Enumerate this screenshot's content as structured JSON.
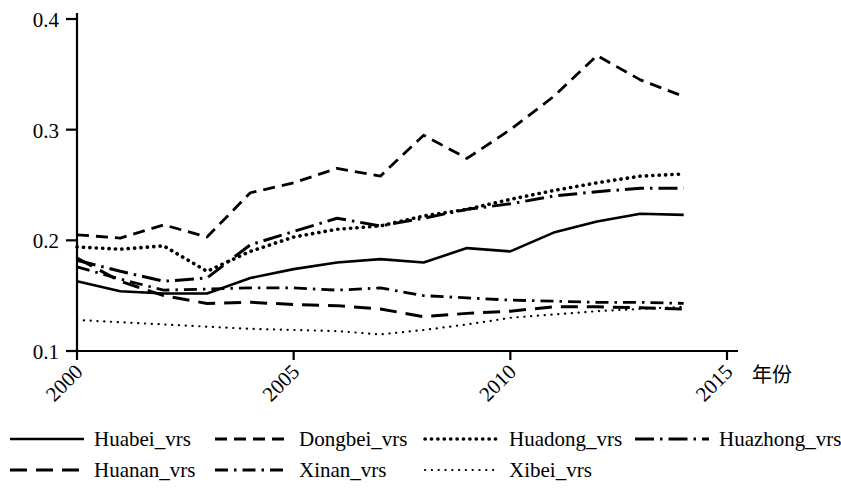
{
  "chart_data": {
    "type": "line",
    "title": "",
    "xlabel": "年份",
    "ylabel": "",
    "xlim": [
      2000,
      2015
    ],
    "ylim": [
      0.1,
      0.4
    ],
    "grid": false,
    "legend_position": "bottom",
    "x": [
      2000,
      2001,
      2002,
      2003,
      2004,
      2005,
      2006,
      2007,
      2008,
      2009,
      2010,
      2011,
      2012,
      2013,
      2014
    ],
    "xticks": [
      "2000",
      "2005",
      "2010",
      "2015"
    ],
    "xtick_values": [
      2000,
      2005,
      2010,
      2015
    ],
    "yticks": [
      "0.1",
      "0.2",
      "0.3",
      "0.4"
    ],
    "ytick_values": [
      0.1,
      0.2,
      0.3,
      0.4
    ],
    "series": [
      {
        "name": "Huabei_vrs",
        "style": "solid",
        "values": [
          0.163,
          0.154,
          0.152,
          0.152,
          0.166,
          0.174,
          0.18,
          0.183,
          0.18,
          0.193,
          0.19,
          0.207,
          0.217,
          0.224,
          0.223
        ]
      },
      {
        "name": "Dongbei_vrs",
        "style": "dashed",
        "values": [
          0.205,
          0.202,
          0.214,
          0.203,
          0.243,
          0.252,
          0.265,
          0.258,
          0.295,
          0.274,
          0.3,
          0.33,
          0.367,
          0.345,
          0.33
        ]
      },
      {
        "name": "Huadong_vrs",
        "style": "dotted",
        "values": [
          0.194,
          0.192,
          0.195,
          0.172,
          0.19,
          0.203,
          0.21,
          0.213,
          0.222,
          0.228,
          0.237,
          0.245,
          0.252,
          0.258,
          0.26
        ]
      },
      {
        "name": "Huazhong_vrs",
        "style": "dashdot-long",
        "values": [
          0.182,
          0.172,
          0.163,
          0.166,
          0.196,
          0.208,
          0.22,
          0.213,
          0.22,
          0.228,
          0.233,
          0.24,
          0.244,
          0.247,
          0.247
        ]
      },
      {
        "name": "Huanan_vrs",
        "style": "longdash",
        "values": [
          0.184,
          0.163,
          0.15,
          0.143,
          0.144,
          0.142,
          0.141,
          0.138,
          0.131,
          0.134,
          0.136,
          0.14,
          0.14,
          0.139,
          0.138
        ]
      },
      {
        "name": "Xinan_vrs",
        "style": "dashdot",
        "values": [
          0.176,
          0.165,
          0.155,
          0.156,
          0.157,
          0.157,
          0.155,
          0.157,
          0.15,
          0.148,
          0.146,
          0.145,
          0.144,
          0.144,
          0.143
        ]
      },
      {
        "name": "Xibei_vrs",
        "style": "finedot",
        "values": [
          0.128,
          0.126,
          0.124,
          0.122,
          0.12,
          0.119,
          0.118,
          0.115,
          0.119,
          0.124,
          0.13,
          0.133,
          0.136,
          0.138,
          0.14
        ]
      }
    ]
  },
  "legend": {
    "rows": [
      [
        {
          "label": "Huabei_vrs",
          "style": "solid"
        },
        {
          "label": "Dongbei_vrs",
          "style": "dashed"
        },
        {
          "label": "Huadong_vrs",
          "style": "dotted"
        },
        {
          "label": "Huazhong_vrs",
          "style": "dashdot-long"
        }
      ],
      [
        {
          "label": "Huanan_vrs",
          "style": "longdash"
        },
        {
          "label": "Xinan_vrs",
          "style": "dashdot"
        },
        {
          "label": "Xibei_vrs",
          "style": "finedot"
        }
      ]
    ]
  },
  "colors": {
    "line": "#000000",
    "axis": "#000000",
    "background": "#ffffff"
  }
}
